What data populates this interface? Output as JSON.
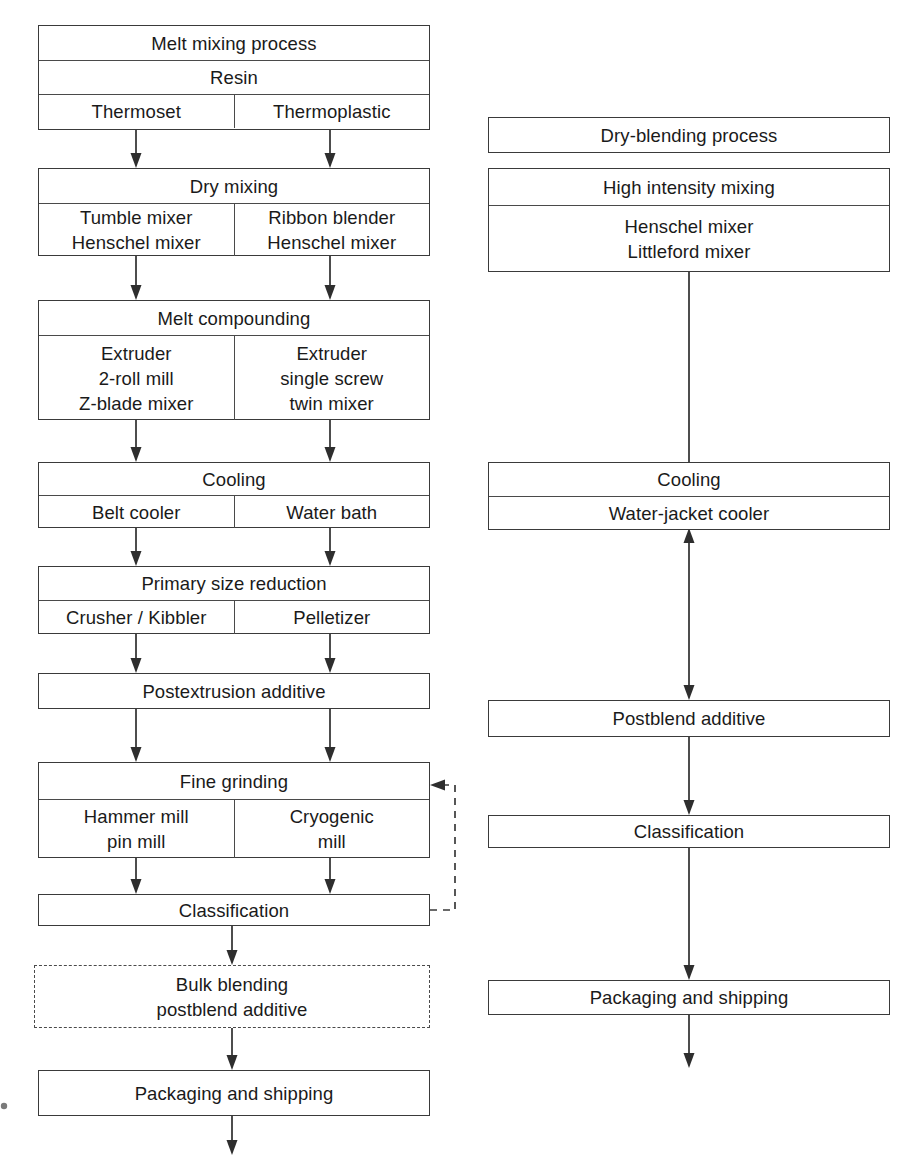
{
  "diagram": {
    "type": "flowchart",
    "columns": [
      {
        "id": "melt-mixing",
        "header": "Melt mixing process"
      },
      {
        "id": "dry-blending",
        "header": "Dry-blending process"
      }
    ]
  },
  "left": {
    "title": "Melt mixing process",
    "resin": {
      "header": "Resin",
      "left": "Thermoset",
      "right": "Thermoplastic"
    },
    "dry_mixing": {
      "header": "Dry mixing",
      "left": "Tumble mixer\nHenschel mixer",
      "right": "Ribbon blender\nHenschel mixer"
    },
    "melt_compounding": {
      "header": "Melt compounding",
      "left": "Extruder\n2-roll mill\nZ-blade mixer",
      "right": "Extruder\nsingle screw\ntwin mixer"
    },
    "cooling": {
      "header": "Cooling",
      "left": "Belt cooler",
      "right": "Water bath"
    },
    "primary_size_reduction": {
      "header": "Primary size reduction",
      "left": "Crusher / Kibbler",
      "right": "Pelletizer"
    },
    "postextrusion_additive": {
      "header": "Postextrusion additive"
    },
    "fine_grinding": {
      "header": "Fine grinding",
      "left": "Hammer mill\npin mill",
      "right": "Cryogenic\nmill"
    },
    "classification": {
      "header": "Classification"
    },
    "bulk_blending": {
      "header": "Bulk blending\npostblend additive"
    },
    "packaging": {
      "header": "Packaging and shipping"
    }
  },
  "right": {
    "title": "Dry-blending process",
    "high_intensity_mixing": {
      "header": "High intensity mixing",
      "body": "Henschel mixer\nLittleford mixer"
    },
    "cooling": {
      "header": "Cooling",
      "body": "Water-jacket cooler"
    },
    "postblend_additive": {
      "header": "Postblend additive"
    },
    "classification": {
      "header": "Classification"
    },
    "packaging": {
      "header": "Packaging and shipping"
    }
  },
  "connectors": {
    "recycle_loop_label": "",
    "styles": {
      "solid": "solid",
      "dashed": "dashed"
    }
  },
  "colors": {
    "stroke": "#2e2e2e",
    "box_border": "#3a3a3a",
    "text": "#1a1a1a",
    "background": "#ffffff"
  }
}
